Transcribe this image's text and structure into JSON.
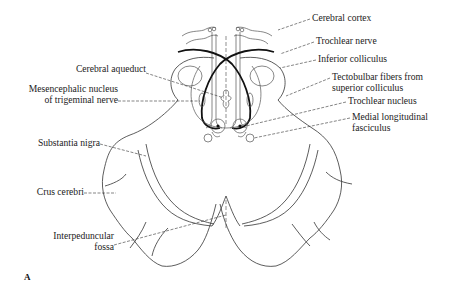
{
  "figure": {
    "panel_letter": "A",
    "labels_left": [
      {
        "id": "cerebral-aqueduct",
        "lines": [
          "Cerebral aqueduct"
        ]
      },
      {
        "id": "mesencephalic-nucleus",
        "lines": [
          "Mesencephalic nucleus",
          "of trigeminal nerve"
        ]
      },
      {
        "id": "substantia-nigra",
        "lines": [
          "Substantia nigra"
        ]
      },
      {
        "id": "crus-cerebri",
        "lines": [
          "Crus cerebri"
        ]
      },
      {
        "id": "interpeduncular-fossa",
        "lines": [
          "Interpeduncular",
          "fossa"
        ]
      }
    ],
    "labels_right": [
      {
        "id": "cerebral-cortex",
        "lines": [
          "Cerebral cortex"
        ]
      },
      {
        "id": "trochlear-nerve",
        "lines": [
          "Trochlear nerve"
        ]
      },
      {
        "id": "inferior-colliculus",
        "lines": [
          "Inferior colliculus"
        ]
      },
      {
        "id": "tectobulbar-fibers",
        "lines": [
          "Tectobulbar fibers from",
          "superior colliculus"
        ]
      },
      {
        "id": "trochlear-nucleus",
        "lines": [
          "Trochlear nucleus"
        ]
      },
      {
        "id": "medial-longitudinal-fasciculus",
        "lines": [
          "Medial longitudinal",
          "fasciculus"
        ]
      }
    ]
  },
  "colors": {
    "background": "#ffffff",
    "line": "#333333",
    "bold_line": "#111111",
    "text": "#222222"
  }
}
